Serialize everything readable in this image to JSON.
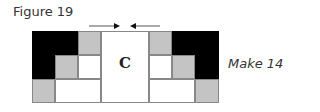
{
  "figure": {
    "title": "Figure 19",
    "caption": "Make 14",
    "center_label": "C"
  },
  "colors": {
    "dark": "#000000",
    "medium": "#c4c4c4",
    "light": "#ffffff",
    "outline": "#888888"
  },
  "annotations": {
    "arrows": [
      "arrow-pointing-right-at-left-seam",
      "arrow-pointing-left-at-right-seam"
    ]
  }
}
